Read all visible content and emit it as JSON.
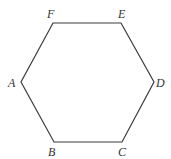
{
  "figure": {
    "shape": "regular-hexagon",
    "stroke_color": "#3a3a3a",
    "background": "#ffffff"
  },
  "vertices": [
    {
      "label": "A",
      "x": 21,
      "y": 82,
      "label_x": 8,
      "label_y": 87
    },
    {
      "label": "B",
      "x": 54,
      "y": 142,
      "label_x": 48,
      "label_y": 156
    },
    {
      "label": "C",
      "x": 122,
      "y": 142,
      "label_x": 118,
      "label_y": 156
    },
    {
      "label": "D",
      "x": 154,
      "y": 82,
      "label_x": 156,
      "label_y": 87
    },
    {
      "label": "E",
      "x": 121,
      "y": 23,
      "label_x": 118,
      "label_y": 18
    },
    {
      "label": "F",
      "x": 53,
      "y": 23,
      "label_x": 47,
      "label_y": 18
    }
  ]
}
